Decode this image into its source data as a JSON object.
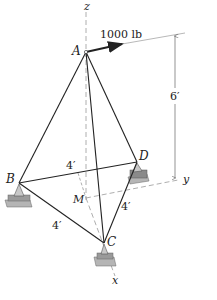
{
  "figure": {
    "force_label": "1000 lb",
    "points": {
      "A": "A",
      "B": "B",
      "C": "C",
      "D": "D",
      "M": "M"
    },
    "axes": {
      "x": "x",
      "y": "y",
      "z": "z"
    },
    "dimensions": {
      "height": "6′",
      "bd": "4′",
      "bc": "4′",
      "cd": "4′"
    },
    "colors": {
      "member": "#222222",
      "dashed": "#999999",
      "support_fill": "#8a8a8a",
      "support_base": "#b5b5b5"
    }
  }
}
